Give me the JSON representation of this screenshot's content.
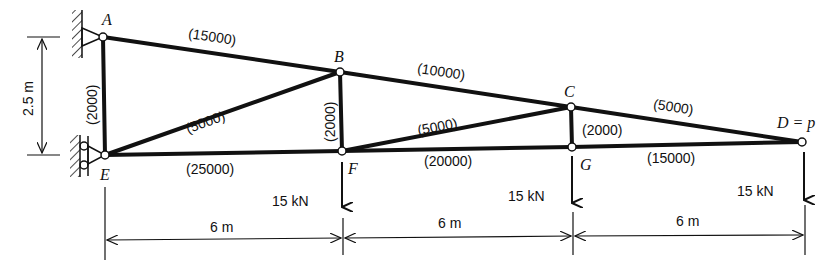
{
  "diagram": {
    "type": "truss",
    "nodes": [
      {
        "id": "A",
        "label": "A",
        "x": 103,
        "y": 37
      },
      {
        "id": "B",
        "label": "B",
        "x": 340,
        "y": 72
      },
      {
        "id": "C",
        "label": "C",
        "x": 571,
        "y": 107
      },
      {
        "id": "D",
        "label": "D = p",
        "x": 802,
        "y": 142
      },
      {
        "id": "E",
        "label": "E",
        "x": 105,
        "y": 155
      },
      {
        "id": "F",
        "label": "F",
        "x": 342,
        "y": 151
      },
      {
        "id": "G",
        "label": "G",
        "x": 572,
        "y": 147
      }
    ],
    "members": [
      {
        "from": "A",
        "to": "B",
        "label": "(15000)"
      },
      {
        "from": "B",
        "to": "C",
        "label": "(10000)"
      },
      {
        "from": "C",
        "to": "D",
        "label": "(5000)"
      },
      {
        "from": "E",
        "to": "F",
        "label": "(25000)"
      },
      {
        "from": "F",
        "to": "G",
        "label": "(20000)"
      },
      {
        "from": "G",
        "to": "D",
        "label": "(15000)"
      },
      {
        "from": "A",
        "to": "E",
        "label": "(2000)"
      },
      {
        "from": "B",
        "to": "F",
        "label": "(2000)"
      },
      {
        "from": "C",
        "to": "G",
        "label": "(2000)"
      },
      {
        "from": "E",
        "to": "B",
        "label": "(5000)"
      },
      {
        "from": "F",
        "to": "C",
        "label": "(5000)"
      }
    ],
    "loads": [
      {
        "node": "F",
        "label": "15 kN"
      },
      {
        "node": "G",
        "label": "15 kN"
      },
      {
        "node": "D",
        "label": "15 kN"
      }
    ],
    "dimensions": {
      "height": "2.5 m",
      "spans": [
        "6 m",
        "6 m",
        "6 m"
      ]
    },
    "supports": [
      {
        "node": "A",
        "type": "pin"
      },
      {
        "node": "E",
        "type": "roller"
      }
    ]
  }
}
